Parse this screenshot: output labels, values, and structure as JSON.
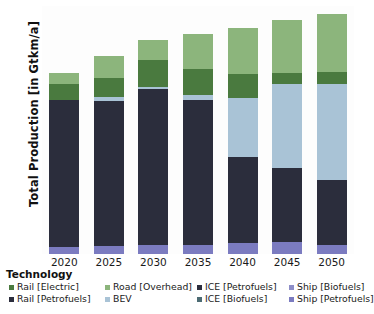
{
  "axes": {
    "ylabel": "Total Production [in Gtkm/a]",
    "yticks": [
      0,
      50,
      100,
      150,
      200,
      250,
      300,
      350,
      400,
      450,
      500,
      550,
      600
    ],
    "xticks": [
      "2020",
      "2025",
      "2030",
      "2035",
      "2040",
      "2045",
      "2050"
    ]
  },
  "legend": {
    "title": "Technology",
    "items": [
      {
        "label": "Rail [Electric]",
        "color": "#4a7a3f"
      },
      {
        "label": "Road [Overhead]",
        "color": "#8cb57c"
      },
      {
        "label": "ICE [Petrofuels]",
        "color": "#2b2d3c"
      },
      {
        "label": "Ship [Biofuels]",
        "color": "#8e8ec8"
      },
      {
        "label": "Rail [Petrofuels]",
        "color": "#2b2d3c"
      },
      {
        "label": "BEV",
        "color": "#a9c3d6"
      },
      {
        "label": "ICE [Biofuels]",
        "color": "#4c6b73"
      },
      {
        "label": "Ship [Petrofuels]",
        "color": "#7b7bc0"
      }
    ]
  },
  "chart_data": {
    "type": "bar",
    "stacked": true,
    "title": "",
    "xlabel": "",
    "ylabel": "Total Production [in Gtkm/a]",
    "ylim": [
      0,
      600
    ],
    "ytick_step": 50,
    "grid": false,
    "legend_position": "bottom",
    "categories": [
      "2020",
      "2025",
      "2030",
      "2035",
      "2040",
      "2045",
      "2050"
    ],
    "series": [
      {
        "name": "Ship [Petrofuels]",
        "color": "#7b7bc0",
        "values": [
          17,
          19,
          21,
          23,
          26,
          30,
          22
        ]
      },
      {
        "name": "ICE [Petrofuels]",
        "color": "#2b2d3c",
        "values": [
          355,
          352,
          378,
          349,
          209,
          177,
          158
        ]
      },
      {
        "name": "BEV",
        "color": "#a9c3d6",
        "values": [
          0,
          10,
          6,
          12,
          143,
          204,
          231
        ]
      },
      {
        "name": "Rail [Electric]",
        "color": "#4a7a3f",
        "values": [
          39,
          46,
          64,
          64,
          57,
          26,
          29
        ]
      },
      {
        "name": "Road [Overhead]",
        "color": "#8cb57c",
        "values": [
          26,
          51,
          49,
          84,
          113,
          128,
          140
        ]
      }
    ],
    "totals": [
      437,
      478,
      518,
      532,
      548,
      565,
      580
    ]
  }
}
